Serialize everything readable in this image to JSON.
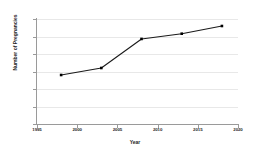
{
  "chart_data": {
    "type": "line",
    "title": "",
    "xlabel": "Year",
    "ylabel": "Number of Pregnancies",
    "xlim": [
      1995,
      2020
    ],
    "ylim": [
      0,
      300
    ],
    "grid": true,
    "legend": "none",
    "marker": "square",
    "line_color": "#1a1a1a",
    "marker_color": "#000000",
    "grid_color": "#e8e8e8",
    "axis_color": "#9a9a9a",
    "x_ticks": [
      1995,
      2000,
      2005,
      2010,
      2015,
      2020
    ],
    "x_tick_labels": [
      "1995",
      "2000",
      "2005",
      "2010",
      "2015",
      "2020"
    ],
    "y_ticks": [
      0,
      50,
      100,
      150,
      200,
      250,
      300
    ],
    "y_tick_labels": [
      "0",
      "50",
      "100",
      "150",
      "200",
      "250",
      "300"
    ],
    "x": [
      1998,
      2003,
      2008,
      2013,
      2018
    ],
    "values": [
      140,
      160,
      243,
      258,
      280
    ],
    "series": [
      {
        "name": "Number of Pregnancies",
        "points": [
          {
            "x": 1998,
            "y": 140
          },
          {
            "x": 2003,
            "y": 160
          },
          {
            "x": 2008,
            "y": 243
          },
          {
            "x": 2013,
            "y": 258
          },
          {
            "x": 2018,
            "y": 280
          }
        ]
      }
    ]
  }
}
